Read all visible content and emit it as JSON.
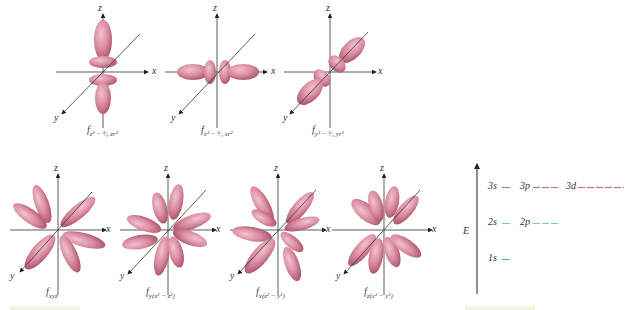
{
  "colors": {
    "lobe": "#d98aa0",
    "lobe_dark": "#b85f7a",
    "axis": "#222222",
    "level_n3": "#d2607c",
    "level_n2": "#7fc1e0",
    "level_n1": "#6ab36a"
  },
  "axes": {
    "x": "x",
    "y": "y",
    "z": "z"
  },
  "top_row": [
    {
      "id": "fz3",
      "caption": "f",
      "subscript": "z³ − ³⁄₅ zr²"
    },
    {
      "id": "fx3",
      "caption": "f",
      "subscript": "x³ − ³⁄₅ xr²"
    },
    {
      "id": "fy3",
      "caption": "f",
      "subscript": "y³ − ³⁄₅ yr²"
    }
  ],
  "bottom_row": [
    {
      "id": "fxyz",
      "caption": "f",
      "subscript": "xyz"
    },
    {
      "id": "fy",
      "caption": "f",
      "subscript": "y(x² − z²)"
    },
    {
      "id": "fx",
      "caption": "f",
      "subscript": "x(z² − y²)"
    },
    {
      "id": "fz",
      "caption": "f",
      "subscript": "z(x² − y²)"
    }
  ],
  "energy_diagram": {
    "axis_label": "E",
    "levels": [
      {
        "shell": 3,
        "label": "3s",
        "count": 1,
        "color_key": "level_n3"
      },
      {
        "shell": 3,
        "label": "3p",
        "count": 3,
        "color_key": "level_n3"
      },
      {
        "shell": 3,
        "label": "3d",
        "count": 5,
        "color_key": "level_n3"
      },
      {
        "shell": 2,
        "label": "2s",
        "count": 1,
        "color_key": "level_n2"
      },
      {
        "shell": 2,
        "label": "2p",
        "count": 3,
        "color_key": "level_n2"
      },
      {
        "shell": 1,
        "label": "1s",
        "count": 1,
        "color_key": "level_n1"
      }
    ]
  }
}
